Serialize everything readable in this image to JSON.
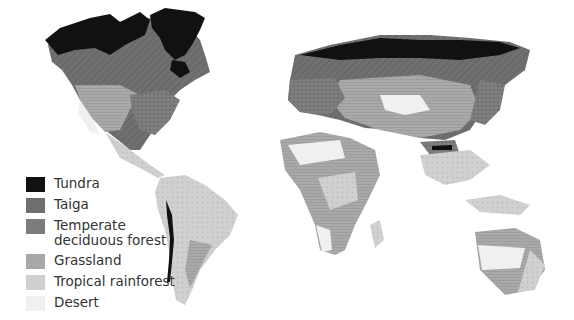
{
  "figure": {
    "type": "world-biome-map",
    "style": "grayscale"
  },
  "legend": {
    "items": [
      {
        "key": "tundra",
        "label": "Tundra",
        "color": "#111111"
      },
      {
        "key": "taiga",
        "label": "Taiga",
        "color": "#6e6e6e"
      },
      {
        "key": "temperate",
        "label": "Temperate deciduous forest",
        "color": "#7c7c7c"
      },
      {
        "key": "grassland",
        "label": "Grassland",
        "color": "#a8a8a8"
      },
      {
        "key": "rainforest",
        "label": "Tropical rainforest",
        "color": "#cfcfcf"
      },
      {
        "key": "desert",
        "label": "Desert",
        "color": "#f0f0f0"
      }
    ]
  }
}
